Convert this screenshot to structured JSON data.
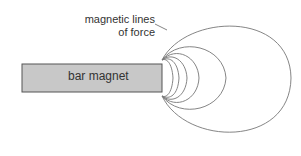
{
  "diagram": {
    "magnet_label": "bar magnet",
    "field_label_line1": "magnetic lines",
    "field_label_line2": "of force",
    "colors": {
      "magnet_fill": "#c8c8c8",
      "stroke": "#555555",
      "line": "#777777"
    }
  }
}
